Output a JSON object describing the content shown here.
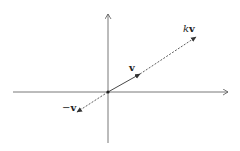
{
  "diagram": {
    "labels": {
      "v": "v",
      "kv_scalar": "k",
      "kv_vec": "v",
      "neg_sign": "−",
      "neg_vec": "v"
    },
    "colors": {
      "stroke": "#333333",
      "background": "#ffffff"
    }
  }
}
